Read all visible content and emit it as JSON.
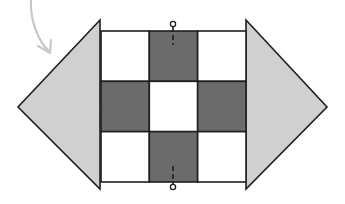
{
  "diagram": {
    "colors": {
      "background": "#ffffff",
      "dark_square": "#6b6b6b",
      "light_square": "#ffffff",
      "triangle_fill": "#d0d0d0",
      "stroke": "#1e1e1e",
      "arrow": "#c8c8c8"
    },
    "grid": {
      "x": 101,
      "y": 31,
      "width": 145,
      "height": 151,
      "rows": 3,
      "cols": 3,
      "pattern": [
        [
          "light",
          "dark",
          "light"
        ],
        [
          "dark",
          "light",
          "dark"
        ],
        [
          "light",
          "dark",
          "light"
        ]
      ]
    },
    "triangles": [
      {
        "name": "left-triangle",
        "points": "100,20 18,107 100,189"
      },
      {
        "name": "right-triangle",
        "points": "246,20 327,107 246,189"
      }
    ],
    "markers": [
      {
        "name": "top-marker",
        "cx": 173,
        "cy": 24,
        "line_y1": 27,
        "line_y2": 45
      },
      {
        "name": "bottom-marker",
        "cx": 173,
        "cy": 187,
        "line_y1": 166,
        "line_y2": 184
      }
    ]
  }
}
